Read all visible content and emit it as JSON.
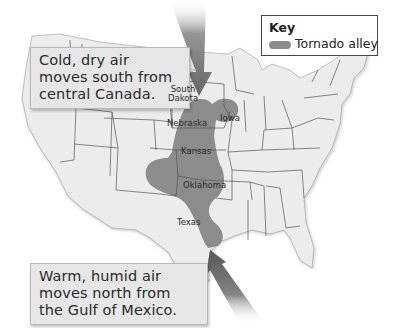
{
  "map": {
    "region": "United States",
    "colors": {
      "land": "#ebebeb",
      "state_border": "#555555",
      "tornado_alley": "#8c8c8c",
      "arrow": "#6e6e6e",
      "callout_bg": "#e6e6e6"
    }
  },
  "key": {
    "title": "Key",
    "items": [
      {
        "label": "Tornado alley",
        "swatch_color": "#8c8c8c"
      }
    ]
  },
  "callouts": {
    "cold": {
      "lines": [
        "Cold, dry air",
        "moves south from",
        "central Canada."
      ],
      "arrow_direction": "south"
    },
    "warm": {
      "lines": [
        "Warm, humid air",
        "moves north from",
        "the Gulf of Mexico."
      ],
      "arrow_direction": "north"
    }
  },
  "state_labels": [
    {
      "name": "South Dakota",
      "line1": "South",
      "line2": "Dakota"
    },
    {
      "name": "Nebraska",
      "line1": "Nebraska"
    },
    {
      "name": "Iowa",
      "line1": "Iowa"
    },
    {
      "name": "Kansas",
      "line1": "Kansas"
    },
    {
      "name": "Oklahoma",
      "line1": "Oklahoma"
    },
    {
      "name": "Texas",
      "line1": "Texas"
    }
  ]
}
